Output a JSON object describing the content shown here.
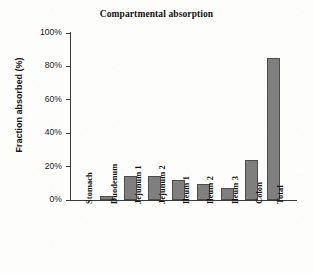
{
  "chart_data": {
    "type": "bar",
    "title": "Compartmental absorption",
    "xlabel": "",
    "ylabel": "Fraction absorbed (%)",
    "categories": [
      "Stomach",
      "Duodenum",
      "Jejunum 1",
      "Jejunum 2",
      "Ileum 1",
      "Ileum 2",
      "Ileum 3",
      "Colon",
      "Total"
    ],
    "values": [
      0,
      2.5,
      14.5,
      14.5,
      12,
      9.5,
      7,
      24,
      85
    ],
    "ylim": [
      0,
      100
    ],
    "yticks": [
      0,
      20,
      40,
      60,
      80,
      100
    ],
    "ytick_labels": [
      "0%",
      "20%",
      "40%",
      "60%",
      "80%",
      "100%"
    ],
    "grid": false,
    "legend": "none",
    "bar_color": "#7f7f7f",
    "bar_edge_color": "#4d4d4d",
    "axis_color": "#3a3a3a"
  }
}
